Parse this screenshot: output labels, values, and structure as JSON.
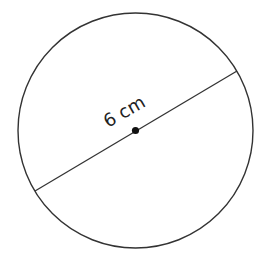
{
  "diagram": {
    "shape": "circle",
    "label": "6 cm",
    "measurement": "diameter",
    "stroke_color": "#333333",
    "center_dot_color": "#111111"
  }
}
